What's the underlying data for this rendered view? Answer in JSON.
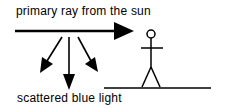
{
  "diagram": {
    "primary_label": "primary ray from the sun",
    "scattered_label": "scattered blue light",
    "elements": {
      "primary_ray": "arrow pointing right toward observer",
      "scattered_rays": [
        "down-left arrow",
        "down arrow",
        "down-right arrow"
      ],
      "observer": "stick figure",
      "ground": "horizontal line"
    },
    "colors": {
      "stroke": "#000000",
      "background": "#ffffff"
    }
  }
}
